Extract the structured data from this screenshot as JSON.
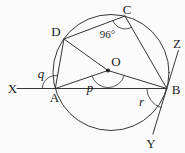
{
  "figure": {
    "point_labels": {
      "X": "X",
      "A": "A",
      "D": "D",
      "C": "C",
      "O": "O",
      "B": "B",
      "Z": "Z",
      "Y": "Y"
    },
    "angle_labels": {
      "angle_at_C": "96°",
      "angle_at_A": "q",
      "angle_at_O": "p",
      "angle_at_B": "r"
    },
    "colors": {
      "stroke": "#2b2b2b",
      "text": "#1d1d1d",
      "background": "#fbfbfb"
    }
  }
}
